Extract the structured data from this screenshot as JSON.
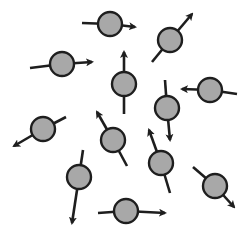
{
  "diagram": {
    "title": "",
    "colors": {
      "background": "#ffffff",
      "circle_fill": "#a8a8a8",
      "stroke": "#1e1e1e"
    },
    "circle_radius": 12,
    "dipoles": [
      {
        "id": 1,
        "cx": 110,
        "cy": 24,
        "tail": [
          82,
          23
        ],
        "head": [
          135,
          27
        ]
      },
      {
        "id": 2,
        "cx": 62,
        "cy": 64,
        "tail": [
          30,
          68
        ],
        "head": [
          92,
          62
        ]
      },
      {
        "id": 3,
        "cx": 170,
        "cy": 40,
        "tail": [
          152,
          62
        ],
        "head": [
          192,
          14
        ]
      },
      {
        "id": 4,
        "cx": 124,
        "cy": 84,
        "tail": [
          124,
          114
        ],
        "head": [
          124,
          52
        ]
      },
      {
        "id": 5,
        "cx": 210,
        "cy": 90,
        "tail": [
          237,
          94
        ],
        "head": [
          182,
          89
        ]
      },
      {
        "id": 6,
        "cx": 167,
        "cy": 108,
        "tail": [
          165,
          80
        ],
        "head": [
          170,
          140
        ]
      },
      {
        "id": 7,
        "cx": 43,
        "cy": 129,
        "tail": [
          66,
          117
        ],
        "head": [
          14,
          146
        ]
      },
      {
        "id": 8,
        "cx": 113,
        "cy": 140,
        "tail": [
          127,
          166
        ],
        "head": [
          97,
          112
        ]
      },
      {
        "id": 9,
        "cx": 161,
        "cy": 163,
        "tail": [
          170,
          193
        ],
        "head": [
          149,
          130
        ]
      },
      {
        "id": 10,
        "cx": 79,
        "cy": 177,
        "tail": [
          83,
          150
        ],
        "head": [
          72,
          223
        ]
      },
      {
        "id": 11,
        "cx": 215,
        "cy": 186,
        "tail": [
          193,
          167
        ],
        "head": [
          234,
          207
        ]
      },
      {
        "id": 12,
        "cx": 126,
        "cy": 211,
        "tail": [
          98,
          213
        ],
        "head": [
          165,
          213
        ]
      }
    ]
  }
}
